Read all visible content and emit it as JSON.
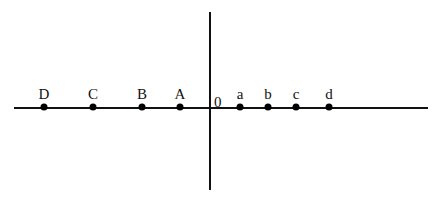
{
  "diagram": {
    "title": "",
    "horizontal_axis": {
      "x1": 14,
      "x2": 428,
      "y": 108,
      "thickness": 2,
      "color": "#111111"
    },
    "vertical_axis": {
      "x": 210,
      "y1": 12,
      "y2": 190,
      "thickness": 2,
      "color": "#111111"
    },
    "origin": {
      "label": "0",
      "x": 214,
      "y": 95
    },
    "points": [
      {
        "label": "D",
        "x": 44,
        "y": 107
      },
      {
        "label": "C",
        "x": 93,
        "y": 107
      },
      {
        "label": "B",
        "x": 142,
        "y": 107
      },
      {
        "label": "A",
        "x": 180,
        "y": 107
      },
      {
        "label": "a",
        "x": 240,
        "y": 107
      },
      {
        "label": "b",
        "x": 268,
        "y": 107
      },
      {
        "label": "c",
        "x": 296,
        "y": 107
      },
      {
        "label": "d",
        "x": 329,
        "y": 107
      }
    ],
    "label_offset_y": -20
  }
}
